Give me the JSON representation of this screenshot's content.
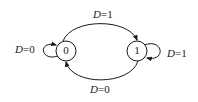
{
  "diagram": {
    "type": "state-transition",
    "states": [
      {
        "id": "s0",
        "label": "0"
      },
      {
        "id": "s1",
        "label": "1"
      }
    ],
    "transitions": [
      {
        "from": "0",
        "to": "0",
        "var": "D",
        "value": "=0",
        "kind": "self-loop"
      },
      {
        "from": "0",
        "to": "1",
        "var": "D",
        "value": "=1",
        "kind": "arc-top"
      },
      {
        "from": "1",
        "to": "1",
        "var": "D",
        "value": "=1",
        "kind": "self-loop"
      },
      {
        "from": "1",
        "to": "0",
        "var": "D",
        "value": "=0",
        "kind": "arc-bottom"
      }
    ],
    "colors": {
      "stroke": "#1a1a1a",
      "background": "#ffffff"
    }
  }
}
